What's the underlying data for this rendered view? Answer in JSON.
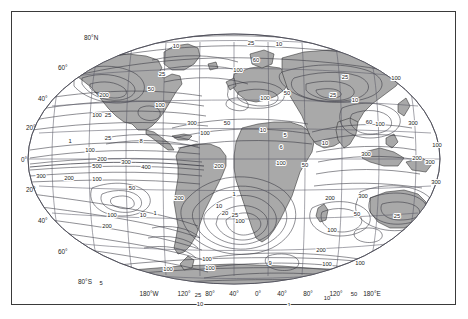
{
  "figure": {
    "type": "contour-world-map",
    "projection": "robinson",
    "land_color": "#a9a9a9",
    "ocean_color": "#ffffff",
    "graticule_color": "#5a5a66",
    "contour_color": "#33333d",
    "frame_color": "#3a3a3a"
  },
  "axes": {
    "longitude_label_row": [
      "180°W",
      "120°",
      "80°",
      "40°",
      "0°",
      "40°",
      "80°",
      "120°",
      "180°E"
    ],
    "longitude_values": [
      -180,
      -120,
      -80,
      -40,
      0,
      40,
      80,
      120,
      180
    ],
    "latitude_labels_left": [
      "80°N",
      "60°",
      "40°",
      "20°",
      "0°",
      "20°",
      "40°",
      "60°",
      "80°S"
    ],
    "latitude_values": [
      80,
      60,
      40,
      20,
      0,
      -20,
      -40,
      -60,
      -80
    ],
    "graticule_lon_step": 40,
    "graticule_lat_step": 20
  },
  "chart_data": {
    "type": "contour",
    "title": "",
    "xlabel": "",
    "ylabel": "",
    "contour_levels": [
      1,
      5,
      6,
      8,
      9,
      10,
      25,
      50,
      100,
      200,
      300,
      400,
      500
    ],
    "labelled_values": [
      "1",
      "5",
      "6",
      "8",
      "9",
      "10",
      "25",
      "50",
      "100",
      "200",
      "300",
      "400",
      "500"
    ],
    "xlim": [
      -180,
      180
    ],
    "ylim": [
      -90,
      90
    ],
    "grid": true,
    "legend": "none"
  },
  "contour_labels": [
    {
      "text": "10",
      "x": 164,
      "y": 36
    },
    {
      "text": "25",
      "x": 239,
      "y": 33
    },
    {
      "text": "10",
      "x": 267,
      "y": 34
    },
    {
      "text": "25",
      "x": 150,
      "y": 64
    },
    {
      "text": "60",
      "x": 244,
      "y": 50
    },
    {
      "text": "100",
      "x": 226,
      "y": 60
    },
    {
      "text": "25",
      "x": 333,
      "y": 67
    },
    {
      "text": "100",
      "x": 384,
      "y": 68
    },
    {
      "text": "200",
      "x": 92,
      "y": 85
    },
    {
      "text": "50",
      "x": 139,
      "y": 79
    },
    {
      "text": "100",
      "x": 148,
      "y": 95
    },
    {
      "text": "100",
      "x": 253,
      "y": 88
    },
    {
      "text": "50",
      "x": 275,
      "y": 83
    },
    {
      "text": "25",
      "x": 321,
      "y": 85
    },
    {
      "text": "10",
      "x": 343,
      "y": 90
    },
    {
      "text": "100",
      "x": 85,
      "y": 105
    },
    {
      "text": "25",
      "x": 96,
      "y": 105
    },
    {
      "text": "300",
      "x": 180,
      "y": 113
    },
    {
      "text": "100",
      "x": 193,
      "y": 123
    },
    {
      "text": "50",
      "x": 215,
      "y": 113
    },
    {
      "text": "10",
      "x": 251,
      "y": 120
    },
    {
      "text": "60",
      "x": 357,
      "y": 112
    },
    {
      "text": "100",
      "x": 368,
      "y": 114
    },
    {
      "text": "300",
      "x": 401,
      "y": 113
    },
    {
      "text": "25",
      "x": 96,
      "y": 128
    },
    {
      "text": "8",
      "x": 129,
      "y": 131
    },
    {
      "text": "1",
      "x": 58,
      "y": 131
    },
    {
      "text": "5",
      "x": 273,
      "y": 125
    },
    {
      "text": "6",
      "x": 269,
      "y": 137
    },
    {
      "text": "10",
      "x": 313,
      "y": 133
    },
    {
      "text": "100",
      "x": 78,
      "y": 140
    },
    {
      "text": "200",
      "x": 90,
      "y": 149
    },
    {
      "text": "300",
      "x": 114,
      "y": 152
    },
    {
      "text": "300",
      "x": 354,
      "y": 144
    },
    {
      "text": "100",
      "x": 425,
      "y": 135
    },
    {
      "text": "200",
      "x": 405,
      "y": 148
    },
    {
      "text": "300",
      "x": 418,
      "y": 152
    },
    {
      "text": "500",
      "x": 85,
      "y": 156
    },
    {
      "text": "400",
      "x": 134,
      "y": 157
    },
    {
      "text": "200",
      "x": 207,
      "y": 156
    },
    {
      "text": "100",
      "x": 269,
      "y": 153
    },
    {
      "text": "50",
      "x": 293,
      "y": 155
    },
    {
      "text": "300",
      "x": 29,
      "y": 166
    },
    {
      "text": "200",
      "x": 57,
      "y": 168
    },
    {
      "text": "100",
      "x": 85,
      "y": 169
    },
    {
      "text": "50",
      "x": 120,
      "y": 178
    },
    {
      "text": "300",
      "x": 424,
      "y": 172
    },
    {
      "text": "1",
      "x": 222,
      "y": 184
    },
    {
      "text": "200",
      "x": 167,
      "y": 188
    },
    {
      "text": "10",
      "x": 207,
      "y": 196
    },
    {
      "text": "20",
      "x": 213,
      "y": 203
    },
    {
      "text": "25",
      "x": 223,
      "y": 205
    },
    {
      "text": "100",
      "x": 228,
      "y": 211
    },
    {
      "text": "100",
      "x": 100,
      "y": 205
    },
    {
      "text": "10",
      "x": 131,
      "y": 205
    },
    {
      "text": "1",
      "x": 143,
      "y": 203
    },
    {
      "text": "50",
      "x": 345,
      "y": 204
    },
    {
      "text": "25",
      "x": 385,
      "y": 206
    },
    {
      "text": "200",
      "x": 95,
      "y": 216
    },
    {
      "text": "200",
      "x": 318,
      "y": 188
    },
    {
      "text": "300",
      "x": 351,
      "y": 186
    },
    {
      "text": "100",
      "x": 320,
      "y": 220
    },
    {
      "text": "200",
      "x": 309,
      "y": 240
    },
    {
      "text": "100",
      "x": 195,
      "y": 249
    },
    {
      "text": "100",
      "x": 198,
      "y": 258
    },
    {
      "text": "100",
      "x": 156,
      "y": 259
    },
    {
      "text": "9",
      "x": 258,
      "y": 253
    },
    {
      "text": "100",
      "x": 315,
      "y": 254
    },
    {
      "text": "100",
      "x": 348,
      "y": 253
    },
    {
      "text": "25",
      "x": 186,
      "y": 285
    },
    {
      "text": "10",
      "x": 188,
      "y": 294
    },
    {
      "text": "10",
      "x": 315,
      "y": 288
    },
    {
      "text": "50",
      "x": 342,
      "y": 284
    },
    {
      "text": "1",
      "x": 277,
      "y": 295
    },
    {
      "text": "5",
      "x": 89,
      "y": 273
    }
  ]
}
